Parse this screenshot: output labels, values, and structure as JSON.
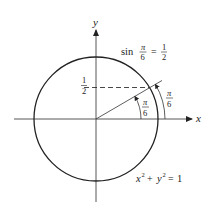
{
  "diagram": {
    "axes": {
      "x_label": "x",
      "y_label": "y"
    },
    "circle_equation": {
      "lhs_x": "x",
      "sup_x": "2",
      "plus": "+",
      "lhs_y": "y",
      "sup_y": "2",
      "equals": "=",
      "rhs": "1"
    },
    "sin_label": {
      "func": "sin",
      "num": "π",
      "den": "6",
      "equals": "=",
      "rhs_num": "1",
      "rhs_den": "2"
    },
    "y_tick": {
      "num": "1",
      "den": "2"
    },
    "angle_inner": {
      "num": "π",
      "den": "6"
    },
    "angle_outer": {
      "num": "π",
      "den": "6"
    },
    "colors": {
      "stroke": "#222222",
      "background": "#ffffff"
    }
  }
}
